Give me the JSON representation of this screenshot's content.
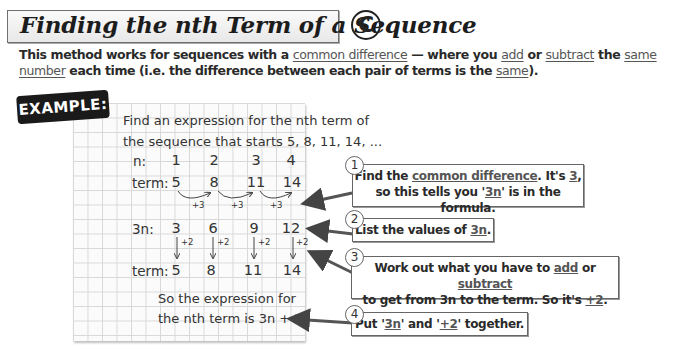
{
  "header": {
    "title": "Finding the nth Term of a Sequence",
    "grade_badge": "C"
  },
  "intro": {
    "p1": "This method works for sequences with a ",
    "link_common_difference": "common difference",
    "p2": " — where you ",
    "link_add": "add",
    "p3": " or ",
    "link_subtract": "subtract",
    "p4": " the ",
    "link_same_number": "same number",
    "p5": " each time (i.e. the difference between each pair of terms is the ",
    "link_same": "same",
    "p6": ")."
  },
  "example": {
    "tag": "EXAMPLE:",
    "question_line1": "Find an expression for the nth term of",
    "question_line2": "the sequence that starts 5, 8, 11, 14, ...",
    "row_n": {
      "label": "n:",
      "values": [
        "1",
        "2",
        "3",
        "4"
      ]
    },
    "row_term": {
      "label": "term:",
      "values": [
        "5",
        "8",
        "11",
        "14"
      ]
    },
    "differences": [
      "+3",
      "+3",
      "+3"
    ],
    "row_3n": {
      "label": "3n:",
      "values": [
        "3",
        "6",
        "9",
        "12"
      ]
    },
    "adjustments": [
      "+2",
      "+2",
      "+2",
      "+2"
    ],
    "row_term2": {
      "label": "term:",
      "values": [
        "5",
        "8",
        "11",
        "14"
      ]
    },
    "conclusion_line1": "So the expression for",
    "conclusion_line2": "the nth term is 3n + 2"
  },
  "steps": [
    {
      "number": "1",
      "a": "Find the ",
      "u1": "common difference",
      "b": ".  It's ",
      "u2": "3",
      "c": ",",
      "line2a": "so this tells you '",
      "u3": "3n",
      "line2b": "' is in the formula."
    },
    {
      "number": "2",
      "a": "List the values of ",
      "u1": "3n",
      "b": "."
    },
    {
      "number": "3",
      "a": "Work out what you have to ",
      "u1": "add",
      "b": " or ",
      "u2": "subtract",
      "line2a": "to get from 3n to the term.  So it's ",
      "u3": "+2",
      "line2b": "."
    },
    {
      "number": "4",
      "a": "Put '",
      "u1": "3n",
      "b": "' and '",
      "u2": "+2",
      "c": "' together."
    }
  ]
}
